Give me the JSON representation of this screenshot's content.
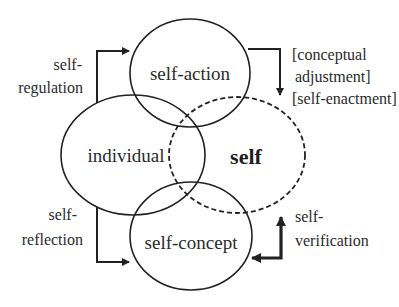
{
  "diagram": {
    "nodes": {
      "self_action": {
        "label": "self-action",
        "cx": 190,
        "cy": 73,
        "rx": 60,
        "ry": 54,
        "dashed": false
      },
      "individual": {
        "label": "individual",
        "cx": 133,
        "cy": 155,
        "rx": 72,
        "ry": 60,
        "dashed": false
      },
      "self": {
        "label": "self",
        "cx": 237,
        "cy": 155,
        "rx": 68,
        "ry": 58,
        "dashed": true,
        "bold": true
      },
      "self_concept": {
        "label": "self-concept",
        "cx": 191,
        "cy": 236,
        "rx": 61,
        "ry": 54,
        "dashed": false
      }
    },
    "edges": {
      "self_regulation": {
        "label_line1": "self-",
        "label_line2": "regulation",
        "from": "individual",
        "to": "self-action"
      },
      "conceptual_adjustment": {
        "label_line1": "[conceptual",
        "label_line2": "adjustment]",
        "label_line3": "[self-enactment]",
        "from": "self-action",
        "to": "self"
      },
      "self_reflection": {
        "label_line1": "self-",
        "label_line2": "reflection",
        "from": "individual",
        "to": "self-concept"
      },
      "self_verification": {
        "label_line1": "self-",
        "label_line2": "verification",
        "from": "self",
        "to": "self-concept",
        "bidirectional": true
      }
    },
    "colors": {
      "stroke": "#222222",
      "text": "#2b2b2b",
      "background": "#ffffff"
    }
  }
}
